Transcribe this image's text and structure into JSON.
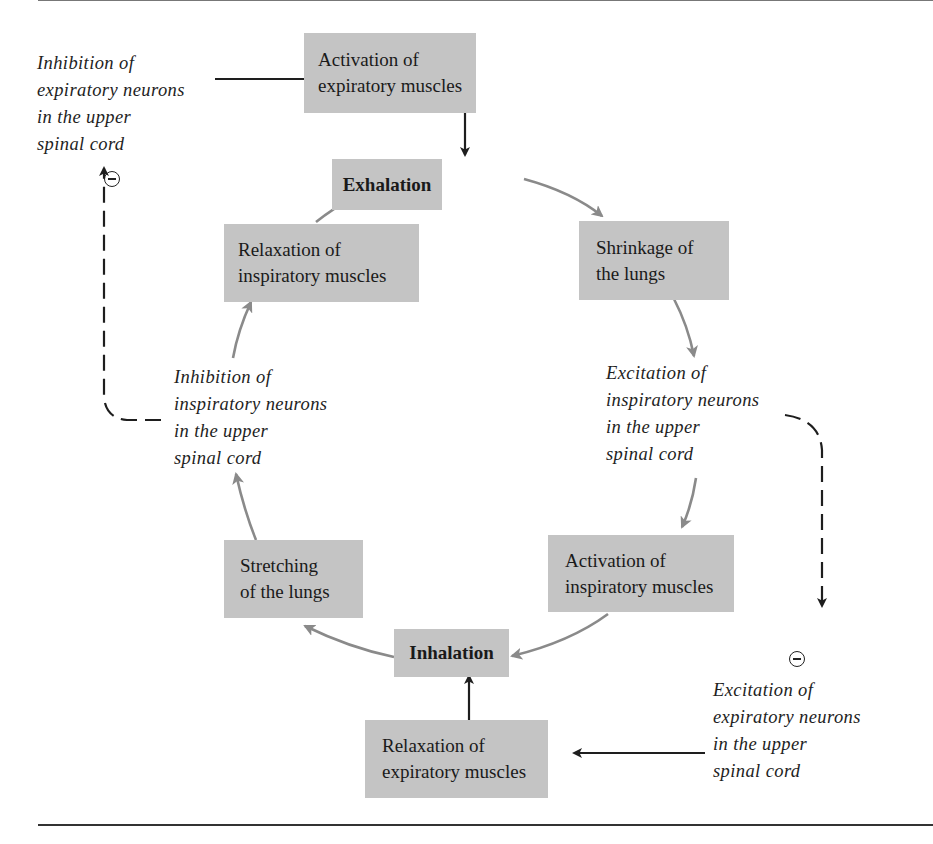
{
  "diagram": {
    "title": "",
    "boxes": {
      "activation_expiratory": {
        "lines": [
          "Activation of",
          "expiratory muscles"
        ]
      },
      "exhalation": {
        "lines": [
          "Exhalation"
        ]
      },
      "shrinkage_lungs": {
        "lines": [
          "Shrinkage of",
          "the lungs"
        ]
      },
      "relaxation_inspiratory": {
        "lines": [
          "Relaxation of",
          "inspiratory  muscles"
        ]
      },
      "stretching_lungs": {
        "lines": [
          "Stretching",
          "of the lungs"
        ]
      },
      "activation_inspiratory": {
        "lines": [
          "Activation of",
          "inspiratory muscles"
        ]
      },
      "inhalation": {
        "lines": [
          "Inhalation"
        ]
      },
      "relaxation_expiratory": {
        "lines": [
          "Relaxation of",
          "expiratory muscles"
        ]
      }
    },
    "notes": {
      "inhibition_expiratory": {
        "lines": [
          "Inhibition of",
          "expiratory neurons",
          "in the upper",
          "spinal cord"
        ]
      },
      "inhibition_inspiratory": {
        "lines": [
          "Inhibition of",
          "inspiratory neurons",
          "in the upper",
          "spinal cord"
        ]
      },
      "excitation_inspiratory": {
        "lines": [
          "Excitation of",
          "inspiratory neurons",
          "in the upper",
          "spinal cord"
        ]
      },
      "excitation_expiratory": {
        "lines": [
          "Excitation of",
          "expiratory neurons",
          "in the upper",
          "spinal cord"
        ]
      }
    },
    "inhibitory_symbol": "minus-circle",
    "colors": {
      "box_fill": "#c4c4c4",
      "cycle_arrow": "#8a8a8a",
      "control_arrow": "#1e1e1e",
      "text": "#1e1e1e"
    },
    "edges": [
      {
        "from": "inhibition_expiratory",
        "to": "activation_expiratory",
        "style": "solid-dark"
      },
      {
        "from": "activation_expiratory",
        "to": "exhalation",
        "style": "solid-dark"
      },
      {
        "from": "exhalation",
        "to": "shrinkage_lungs",
        "style": "cycle-gray"
      },
      {
        "from": "shrinkage_lungs",
        "to": "excitation_inspiratory",
        "style": "cycle-gray"
      },
      {
        "from": "excitation_inspiratory",
        "to": "activation_inspiratory",
        "style": "cycle-gray"
      },
      {
        "from": "activation_inspiratory",
        "to": "inhalation",
        "style": "cycle-gray"
      },
      {
        "from": "inhalation",
        "to": "stretching_lungs",
        "style": "cycle-gray"
      },
      {
        "from": "stretching_lungs",
        "to": "inhibition_inspiratory",
        "style": "cycle-gray"
      },
      {
        "from": "inhibition_inspiratory",
        "to": "relaxation_inspiratory",
        "style": "cycle-gray"
      },
      {
        "from": "relaxation_inspiratory",
        "to": "exhalation",
        "style": "cycle-gray"
      },
      {
        "from": "inhibition_inspiratory",
        "to": "inhibition_expiratory",
        "style": "dashed-inhibitory"
      },
      {
        "from": "excitation_inspiratory",
        "to": "excitation_expiratory",
        "style": "dashed-inhibitory"
      },
      {
        "from": "excitation_expiratory",
        "to": "relaxation_expiratory",
        "style": "solid-dark"
      },
      {
        "from": "relaxation_expiratory",
        "to": "inhalation",
        "style": "solid-dark"
      }
    ]
  }
}
